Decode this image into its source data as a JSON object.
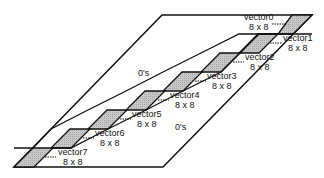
{
  "diagram": {
    "regions": [
      {
        "label": "0's",
        "x": 140,
        "y": 68
      },
      {
        "label": "0's",
        "x": 177,
        "y": 122
      }
    ],
    "blocks": [
      {
        "name": "vector0",
        "size": "8 x 8",
        "lx": 245,
        "ly": 14
      },
      {
        "name": "vector1",
        "size": "8 x 8",
        "lx": 281,
        "ly": 35
      },
      {
        "name": "vector2",
        "size": "8 x 8",
        "lx": 245,
        "ly": 54
      },
      {
        "name": "vector3",
        "size": "8 x 8",
        "lx": 206,
        "ly": 73
      },
      {
        "name": "vector4",
        "size": "8 x 8",
        "lx": 168,
        "ly": 92
      },
      {
        "name": "vector5",
        "size": "8 x 8",
        "lx": 132,
        "ly": 111
      },
      {
        "name": "vector6",
        "size": "8 x 8",
        "lx": 94,
        "ly": 130
      },
      {
        "name": "vector7",
        "size": "8 x 8",
        "lx": 57,
        "ly": 149
      }
    ]
  }
}
